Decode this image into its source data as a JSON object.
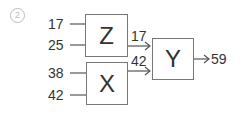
{
  "problem": {
    "number": "2"
  },
  "gates": {
    "z": {
      "label": "Z",
      "inputs": [
        "17",
        "25"
      ],
      "output": "17"
    },
    "x": {
      "label": "X",
      "inputs": [
        "38",
        "42"
      ],
      "output": "42"
    },
    "y": {
      "label": "Y",
      "inputs": [
        "17",
        "42"
      ],
      "output": "59"
    }
  }
}
